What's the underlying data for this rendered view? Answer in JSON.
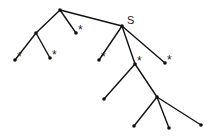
{
  "diagram": {
    "type": "tree",
    "colors": {
      "line": "#111111",
      "background": "#ffffff"
    },
    "nodes": [
      {
        "id": "root",
        "x": 60,
        "y": 10,
        "label": ""
      },
      {
        "id": "a",
        "x": 36,
        "y": 33,
        "label": ""
      },
      {
        "id": "a1",
        "x": 15,
        "y": 60,
        "label": "*"
      },
      {
        "id": "a2",
        "x": 50,
        "y": 58,
        "label": "*"
      },
      {
        "id": "b",
        "x": 76,
        "y": 33,
        "label": "*"
      },
      {
        "id": "S",
        "x": 122,
        "y": 26,
        "label": "S"
      },
      {
        "id": "s1",
        "x": 99,
        "y": 60,
        "label": "*"
      },
      {
        "id": "s2",
        "x": 135,
        "y": 64,
        "label": "*"
      },
      {
        "id": "s3",
        "x": 165,
        "y": 63,
        "label": "*"
      },
      {
        "id": "c1",
        "x": 104,
        "y": 99,
        "label": ""
      },
      {
        "id": "c2",
        "x": 157,
        "y": 97,
        "label": ""
      },
      {
        "id": "d1",
        "x": 134,
        "y": 126,
        "label": ""
      },
      {
        "id": "d2",
        "x": 169,
        "y": 128,
        "label": ""
      },
      {
        "id": "d3",
        "x": 201,
        "y": 125,
        "label": ""
      }
    ],
    "edges": [
      [
        "root",
        "a"
      ],
      [
        "a",
        "a1"
      ],
      [
        "a",
        "a2"
      ],
      [
        "root",
        "b"
      ],
      [
        "root",
        "S"
      ],
      [
        "S",
        "s1"
      ],
      [
        "S",
        "s2"
      ],
      [
        "S",
        "s3"
      ],
      [
        "s2",
        "c1"
      ],
      [
        "s2",
        "c2"
      ],
      [
        "c2",
        "d1"
      ],
      [
        "c2",
        "d2"
      ],
      [
        "c2",
        "d3"
      ]
    ]
  }
}
